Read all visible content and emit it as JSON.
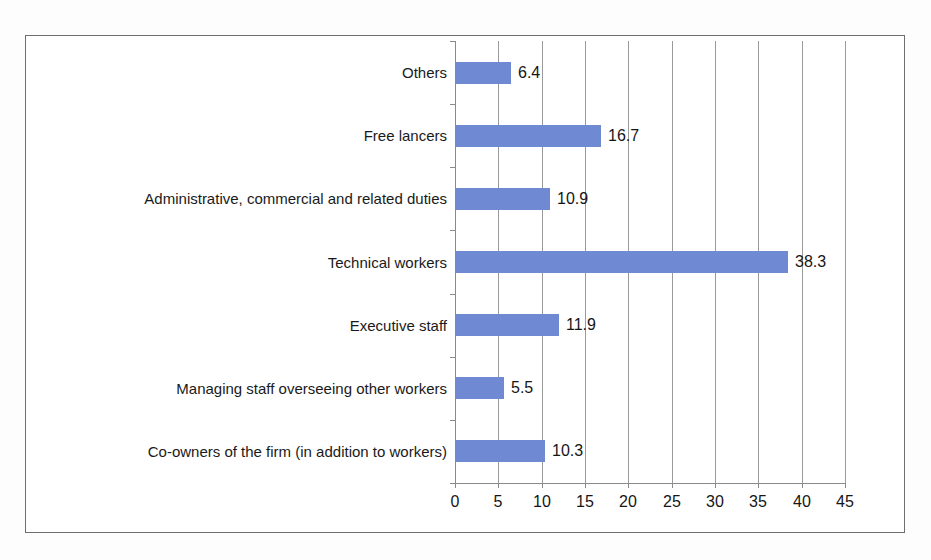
{
  "chart_data": {
    "type": "bar",
    "orientation": "horizontal",
    "title": "",
    "xlabel": "",
    "ylabel": "",
    "xlim": [
      0,
      45
    ],
    "xticks": [
      "0",
      "5",
      "10",
      "15",
      "20",
      "25",
      "30",
      "35",
      "40",
      "45"
    ],
    "grid": true,
    "legend": false,
    "series_color": "#6f8ad2",
    "categories": [
      "Others",
      "Free lancers",
      "Administrative, commercial and related duties",
      "Technical workers",
      "Executive staff",
      "Managing staff overseeing other workers",
      "Co-owners of the firm (in addition to workers)"
    ],
    "values": [
      6.4,
      16.7,
      10.9,
      38.3,
      11.9,
      5.5,
      10.3
    ],
    "value_labels": [
      "6.4",
      "16.7",
      "10.9",
      "38.3",
      "11.9",
      "5.5",
      "10.3"
    ]
  },
  "axis": {
    "tick_labels": [
      "0",
      "5",
      "10",
      "15",
      "20",
      "25",
      "30",
      "35",
      "40",
      "45"
    ]
  }
}
